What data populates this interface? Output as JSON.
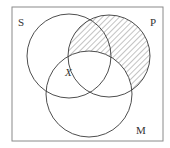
{
  "diagram": {
    "type": "venn-3",
    "universe_border": true,
    "sets": [
      {
        "id": "S",
        "label": "S"
      },
      {
        "id": "P",
        "label": "P"
      },
      {
        "id": "M",
        "label": "M"
      }
    ],
    "shaded_region": {
      "description": "P outside M",
      "pattern": "diagonal-hatch"
    },
    "marker": {
      "label": "X",
      "region": "on boundary of P within S ∩ M"
    },
    "colors": {
      "line": "#3a3a3a",
      "frame": "#8a8a8a",
      "hatch": "#6a6a6a",
      "background": "#ffffff"
    }
  }
}
